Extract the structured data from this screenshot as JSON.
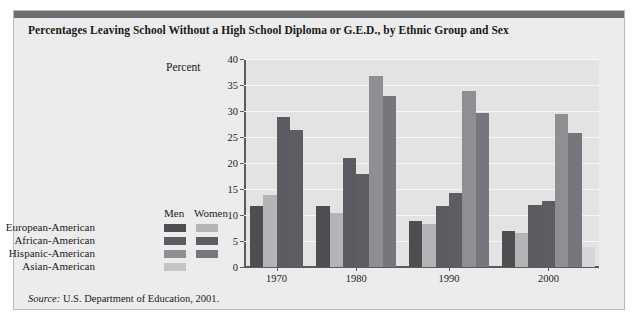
{
  "figure": {
    "title": "Percentages Leaving School Without a High School Diploma or G.E.D., by Ethnic Group and Sex",
    "source_prefix": "Source:",
    "source_text": " U.S. Department of Education, 2001.",
    "band_color": "#6d6e72",
    "panel_color": "#ececed",
    "plot_color": "#e3e3e4"
  },
  "legend": {
    "col_men": "Men",
    "col_women": "Women",
    "rows": [
      {
        "label": "European-American",
        "men_color": "#4d4d52",
        "women_color": "#b4b4b7",
        "has_women": true
      },
      {
        "label": "African-American",
        "men_color": "#5b5b61",
        "women_color": "#5d5d63",
        "has_women": true
      },
      {
        "label": "Hispanic-American",
        "men_color": "#8e8e93",
        "women_color": "#76767c",
        "has_women": true
      },
      {
        "label": "Asian-American",
        "men_color": "#c4c4c7",
        "women_color": "#d6d6d8",
        "has_women": false
      }
    ]
  },
  "chart_data": {
    "type": "bar",
    "title": "Percentages Leaving School Without a High School Diploma or G.E.D., by Ethnic Group and Sex",
    "xlabel": "",
    "ylabel": "Percent",
    "ylim": [
      0,
      40
    ],
    "yticks": [
      0,
      5,
      10,
      15,
      20,
      25,
      30,
      35,
      40
    ],
    "grid": true,
    "legend_position": "left",
    "categories": [
      "1970",
      "1980",
      "1990",
      "2000"
    ],
    "series": [
      {
        "name": "European-American Men",
        "color": "#4d4d52",
        "values": [
          11.8,
          11.8,
          8.8,
          7.0
        ]
      },
      {
        "name": "European-American Women",
        "color": "#b4b4b7",
        "values": [
          13.9,
          10.3,
          8.2,
          6.5
        ]
      },
      {
        "name": "African-American Men",
        "color": "#5b5b61",
        "values": [
          28.8,
          20.9,
          11.7,
          12.0
        ]
      },
      {
        "name": "African-American Women",
        "color": "#5d5d63",
        "values": [
          26.3,
          17.8,
          14.2,
          12.6
        ]
      },
      {
        "name": "Hispanic-American Men",
        "color": "#8e8e93",
        "values": [
          null,
          36.7,
          33.8,
          29.5
        ]
      },
      {
        "name": "Hispanic-American Women",
        "color": "#76767c",
        "values": [
          null,
          32.8,
          29.7,
          25.7
        ]
      },
      {
        "name": "Asian-American Men",
        "color": "#c4c4c7",
        "values": [
          null,
          null,
          null,
          null
        ]
      },
      {
        "name": "Asian-American Women",
        "color": "#d6d6d8",
        "values": [
          null,
          null,
          null,
          3.9
        ]
      }
    ],
    "bars": [
      {
        "group": "1970",
        "series": "European-American Men",
        "value": 11.8,
        "color": "#4d4d52"
      },
      {
        "group": "1970",
        "series": "European-American Women",
        "value": 13.9,
        "color": "#b4b4b7"
      },
      {
        "group": "1970",
        "series": "African-American Men",
        "value": 28.8,
        "color": "#5b5b61"
      },
      {
        "group": "1970",
        "series": "African-American Women",
        "value": 26.3,
        "color": "#5d5d63"
      },
      {
        "group": "1980",
        "series": "European-American Men",
        "value": 11.8,
        "color": "#4d4d52"
      },
      {
        "group": "1980",
        "series": "European-American Women",
        "value": 10.3,
        "color": "#b4b4b7"
      },
      {
        "group": "1980",
        "series": "African-American Men",
        "value": 20.9,
        "color": "#5b5b61"
      },
      {
        "group": "1980",
        "series": "African-American Women",
        "value": 17.8,
        "color": "#5d5d63"
      },
      {
        "group": "1980",
        "series": "Hispanic-American Men",
        "value": 36.7,
        "color": "#8e8e93"
      },
      {
        "group": "1980",
        "series": "Hispanic-American Women",
        "value": 32.8,
        "color": "#76767c"
      },
      {
        "group": "1990",
        "series": "European-American Men",
        "value": 8.8,
        "color": "#4d4d52"
      },
      {
        "group": "1990",
        "series": "European-American Women",
        "value": 8.2,
        "color": "#b4b4b7"
      },
      {
        "group": "1990",
        "series": "African-American Men",
        "value": 11.7,
        "color": "#5b5b61"
      },
      {
        "group": "1990",
        "series": "African-American Women",
        "value": 14.2,
        "color": "#5d5d63"
      },
      {
        "group": "1990",
        "series": "Hispanic-American Men",
        "value": 33.8,
        "color": "#8e8e93"
      },
      {
        "group": "1990",
        "series": "Hispanic-American Women",
        "value": 29.7,
        "color": "#76767c"
      },
      {
        "group": "2000",
        "series": "European-American Men",
        "value": 7.0,
        "color": "#4d4d52"
      },
      {
        "group": "2000",
        "series": "European-American Women",
        "value": 6.5,
        "color": "#b4b4b7"
      },
      {
        "group": "2000",
        "series": "African-American Men",
        "value": 12.0,
        "color": "#5b5b61"
      },
      {
        "group": "2000",
        "series": "African-American Women",
        "value": 12.6,
        "color": "#5d5d63"
      },
      {
        "group": "2000",
        "series": "Hispanic-American Men",
        "value": 29.5,
        "color": "#8e8e93"
      },
      {
        "group": "2000",
        "series": "Hispanic-American Women",
        "value": 25.7,
        "color": "#76767c"
      },
      {
        "group": "2000",
        "series": "Asian-American Women",
        "value": 3.9,
        "color": "#d6d6d8"
      }
    ]
  }
}
